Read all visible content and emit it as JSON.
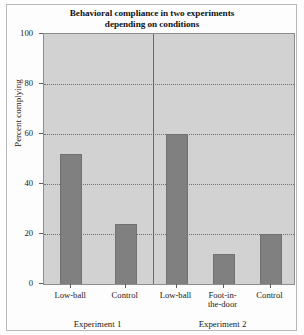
{
  "chart_data": {
    "type": "bar",
    "title": "Behavioral compliance in two experiments depending on conditions",
    "title_line1": "Behavioral compliance in two experiments",
    "title_line2": "depending on conditions",
    "xlabel": "",
    "ylabel": "Percent complying",
    "ylim": [
      0,
      100
    ],
    "yticks": [
      0,
      20,
      40,
      60,
      80,
      100
    ],
    "ytick_labels": [
      "0",
      "20",
      "40",
      "60",
      "80",
      "100"
    ],
    "grid": "horizontal-dotted",
    "legend": "none",
    "categories": [
      "Low-ball",
      "Control",
      "Low-ball",
      "Foot-in-the-door",
      "Control"
    ],
    "values": [
      52,
      24,
      60,
      12,
      20
    ],
    "bars": [
      {
        "label": "Low-ball",
        "label_line1": "Low-ball",
        "label_line2": "",
        "value": 52,
        "group": "Experiment 1"
      },
      {
        "label": "Control",
        "label_line1": "Control",
        "label_line2": "",
        "value": 24,
        "group": "Experiment 1"
      },
      {
        "label": "Low-ball",
        "label_line1": "Low-ball",
        "label_line2": "",
        "value": 60,
        "group": "Experiment 2"
      },
      {
        "label": "Foot-in-the-door",
        "label_line1": "Foot-in-",
        "label_line2": "the-door",
        "value": 12,
        "group": "Experiment 2"
      },
      {
        "label": "Control",
        "label_line1": "Control",
        "label_line2": "",
        "value": 20,
        "group": "Experiment 2"
      }
    ],
    "groups": [
      {
        "name": "Experiment 1",
        "bar_indices": [
          0,
          1
        ]
      },
      {
        "name": "Experiment 2",
        "bar_indices": [
          2,
          3,
          4
        ]
      }
    ],
    "colors": {
      "bar_fill": "#808080",
      "bar_edge": "#717171",
      "plot_background": "#d2d2d2",
      "grid": "#6f6f6f",
      "axis": "#5d5d5d",
      "text": "#1a1a1a",
      "page_background": "#fdfdfd",
      "page_border": "#b9b9b9"
    }
  }
}
